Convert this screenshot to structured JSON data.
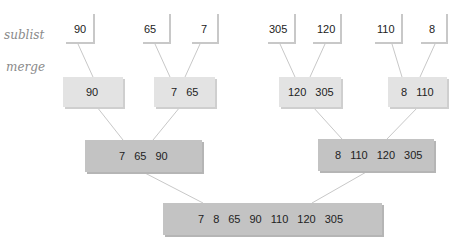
{
  "labels": {
    "sublist": "sublist",
    "merge": "merge"
  },
  "leaves": [
    "90",
    "65",
    "7",
    "305",
    "120",
    "110",
    "8"
  ],
  "level2": [
    [
      "90"
    ],
    [
      "7",
      "65"
    ],
    [
      "120",
      "305"
    ],
    [
      "8",
      "110"
    ]
  ],
  "level3": [
    [
      "7",
      "65",
      "90"
    ],
    [
      "8",
      "110",
      "120",
      "305"
    ]
  ],
  "result": [
    "7",
    "8",
    "65",
    "90",
    "110",
    "120",
    "305"
  ],
  "colors": {
    "leaf": "#ffffff",
    "level2": "#e3e3e3",
    "level3": "#c3c3c3",
    "line": "#c8c8c8"
  }
}
